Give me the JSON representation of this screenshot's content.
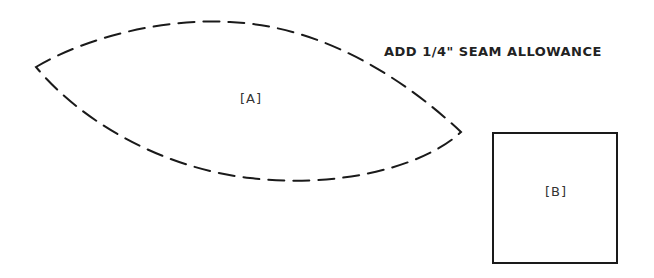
{
  "instruction": "ADD 1/4\" SEAM ALLOWANCE",
  "pieces": [
    {
      "id": "A",
      "label": "[A]",
      "shape": "lens / pointed oval",
      "outline": "dashed"
    },
    {
      "id": "B",
      "label": "[B]",
      "shape": "square",
      "outline": "solid"
    }
  ],
  "colors": {
    "line": "#1a1a1a",
    "background": "#ffffff"
  }
}
